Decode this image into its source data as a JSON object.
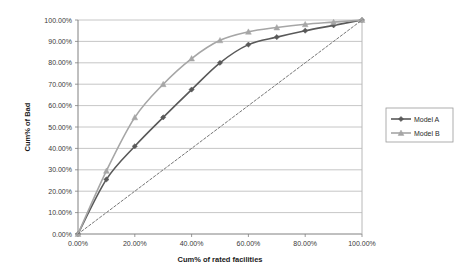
{
  "chart_data": {
    "type": "line",
    "title": "",
    "xlabel": "Cum% of rated facilities",
    "ylabel": "Cum% of Bad",
    "xlim": [
      0,
      100
    ],
    "ylim": [
      0,
      100
    ],
    "grid": true,
    "grid_axis": "y",
    "legend_position": "right",
    "x_tick_labels": [
      "0.00%",
      "20.00%",
      "40.00%",
      "60.00%",
      "80.00%",
      "100.00%"
    ],
    "x_tick_values": [
      0,
      20,
      40,
      60,
      80,
      100
    ],
    "y_tick_labels": [
      "0.00%",
      "10.00%",
      "20.00%",
      "30.00%",
      "40.00%",
      "50.00%",
      "60.00%",
      "70.00%",
      "80.00%",
      "90.00%",
      "100.00%"
    ],
    "y_tick_values": [
      0,
      10,
      20,
      30,
      40,
      50,
      60,
      70,
      80,
      90,
      100
    ],
    "x": [
      0,
      10,
      20,
      30,
      40,
      50,
      60,
      70,
      80,
      90,
      100
    ],
    "series": [
      {
        "name": "Model A",
        "color": "#595959",
        "marker": "diamond",
        "dash": "none",
        "values": [
          0,
          25.5,
          41.0,
          54.5,
          67.5,
          80.0,
          88.5,
          92.0,
          95.0,
          97.5,
          100.0
        ]
      },
      {
        "name": "Model B",
        "color": "#a6a6a6",
        "marker": "triangle",
        "dash": "none",
        "values": [
          0,
          29.5,
          54.5,
          70.0,
          82.0,
          90.5,
          94.5,
          96.5,
          98.0,
          99.0,
          100.0
        ]
      },
      {
        "name": "Random",
        "color": "#666666",
        "marker": "none",
        "dash": "dashed",
        "show_in_legend": false,
        "values": [
          0,
          10,
          20,
          30,
          40,
          50,
          60,
          70,
          80,
          90,
          100
        ]
      }
    ]
  },
  "legend": {
    "entries": [
      {
        "label": "Model A"
      },
      {
        "label": "Model B"
      }
    ]
  },
  "axes": {
    "x_title": "Cum% of rated facilities",
    "y_title": "Cum% of Bad"
  },
  "colors": {
    "model_a": "#595959",
    "model_b": "#a6a6a6",
    "random_line": "#666666",
    "grid": "#b8b8b8",
    "axis": "#808080",
    "plot_background": "#ffffff",
    "text": "#3a3a3a"
  }
}
